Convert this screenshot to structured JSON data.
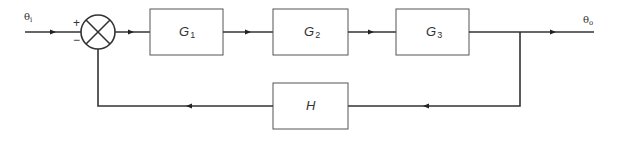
{
  "diagram": {
    "type": "closed-loop block diagram",
    "input_signal": {
      "symbol": "θ",
      "subscript": "i"
    },
    "output_signal": {
      "symbol": "θ",
      "subscript": "o"
    },
    "summing_junction": {
      "plus_sign": "+",
      "minus_sign": "−"
    },
    "forward_blocks": [
      {
        "name": "G",
        "subscript": "1"
      },
      {
        "name": "G",
        "subscript": "2"
      },
      {
        "name": "G",
        "subscript": "3"
      }
    ],
    "feedback_block": {
      "name": "H"
    },
    "colors": {
      "line": "#333333",
      "block_border": "#555555",
      "background": "#ffffff"
    }
  }
}
